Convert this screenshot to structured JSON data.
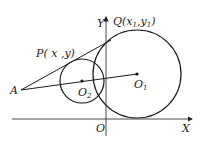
{
  "diagram": {
    "type": "geometry",
    "labels": {
      "y_axis": "Y",
      "x_axis": "X",
      "origin": "O",
      "Q": {
        "name": "Q",
        "coords": "(x",
        "x_sub": "1",
        "sep": ",y",
        "y_sub": "1",
        "close": ")"
      },
      "P": "P( x ,y)",
      "A": "A",
      "O1": {
        "name": "O",
        "sub": "1"
      },
      "O2": {
        "name": "O",
        "sub": "2"
      }
    },
    "colors": {
      "stroke": "#1a1a1a",
      "background": "#ffffff"
    }
  }
}
